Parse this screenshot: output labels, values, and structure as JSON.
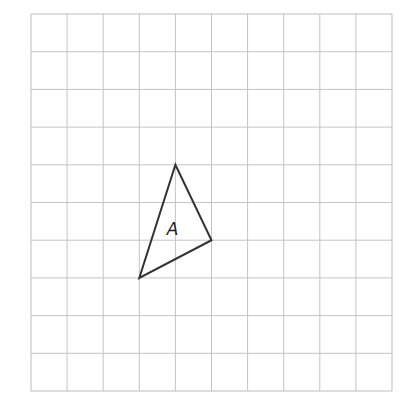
{
  "grid": {
    "columns": 10,
    "rows": 10,
    "origin_x": 31,
    "origin_y": 14,
    "cell_width": 36.1,
    "cell_height": 37.7,
    "line_color": "#c4c4c4",
    "border_color": "#bdbdbd"
  },
  "shapes": [
    {
      "label": "A",
      "type": "triangle",
      "vertices_grid": [
        [
          4,
          4
        ],
        [
          5,
          6
        ],
        [
          3,
          7
        ]
      ],
      "stroke_color": "#333333",
      "stroke_width": 2,
      "label_grid": [
        3.92,
        5.85
      ]
    }
  ]
}
